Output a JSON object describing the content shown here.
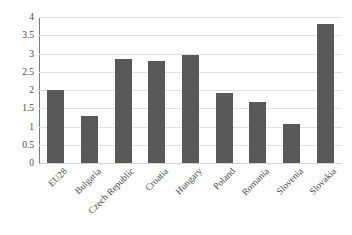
{
  "chart_data": {
    "type": "bar",
    "title": "",
    "subtitle": "",
    "xlabel": "",
    "ylabel": "",
    "categories": [
      "EU28",
      "Bulgaria",
      "Czech Republic",
      "Croatia",
      "Hungary",
      "Poland",
      "Romania",
      "Slovenia",
      "Slovakia"
    ],
    "values": [
      2.0,
      1.3,
      2.85,
      2.8,
      2.95,
      1.92,
      1.68,
      1.07,
      3.8
    ],
    "ylim": [
      0,
      4
    ],
    "ytick_step": 0.5,
    "ytick_labels": [
      "4",
      "3.5",
      "3",
      "2.5",
      "2",
      "1.5",
      "1",
      "0.5",
      "0"
    ],
    "ytick_values": [
      4,
      3.5,
      3,
      2.5,
      2,
      1.5,
      1,
      0.5,
      0
    ],
    "grid": "horizontal",
    "legend": "none",
    "bar_color": "#595959",
    "gridline_color": "#e2e2e2",
    "axis_color": "#7b7b7b",
    "background_color": "#ffffff",
    "xtick_label_rotation": "-45"
  }
}
